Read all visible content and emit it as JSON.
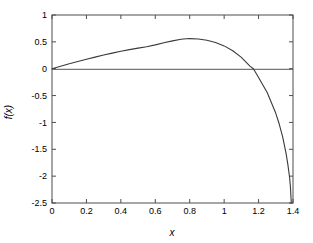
{
  "chart_data": {
    "type": "line",
    "title": "",
    "xlabel": "x",
    "ylabel": "f(x)",
    "xlim": [
      0,
      1.4
    ],
    "ylim": [
      -2.5,
      1
    ],
    "grid": false,
    "legend": null,
    "xticks": [
      "0",
      "0.2",
      "0.4",
      "0.6",
      "0.8",
      "1",
      "1.2",
      "1.4"
    ],
    "xtick_values": [
      0,
      0.2,
      0.4,
      0.6,
      0.8,
      1.0,
      1.2,
      1.4
    ],
    "yticks": [
      "1",
      "0.5",
      "0",
      "-0.5",
      "-1",
      "-1.5",
      "-2",
      "-2.5"
    ],
    "ytick_values": [
      1,
      0.5,
      0,
      -0.5,
      -1,
      -1.5,
      -2,
      -2.5
    ],
    "annotations": {
      "zero_line": 0,
      "peak_x": 0.78,
      "peak_y": 0.56,
      "root_x": 1.17,
      "start_point": [
        0,
        0
      ],
      "end_point": [
        1.39,
        -2.5
      ]
    },
    "series": [
      {
        "name": "f(x)",
        "color": "#3a3a3a",
        "x": [
          0,
          0.05,
          0.1,
          0.15,
          0.2,
          0.25,
          0.3,
          0.35,
          0.4,
          0.45,
          0.5,
          0.55,
          0.6,
          0.65,
          0.7,
          0.75,
          0.78,
          0.8,
          0.85,
          0.9,
          0.95,
          1.0,
          1.05,
          1.1,
          1.15,
          1.17,
          1.2,
          1.25,
          1.3,
          1.32,
          1.34,
          1.36,
          1.37,
          1.38,
          1.385,
          1.39
        ],
        "y": [
          0,
          0.046,
          0.091,
          0.134,
          0.176,
          0.216,
          0.254,
          0.29,
          0.324,
          0.355,
          0.384,
          0.41,
          0.444,
          0.482,
          0.518,
          0.548,
          0.558,
          0.56,
          0.552,
          0.53,
          0.489,
          0.425,
          0.334,
          0.211,
          0.048,
          0.0,
          -0.162,
          -0.444,
          -0.83,
          -1.03,
          -1.27,
          -1.58,
          -1.78,
          -2.02,
          -2.2,
          -2.5
        ]
      }
    ]
  },
  "axes": {
    "x_title": "x",
    "y_title": "f(x)"
  }
}
